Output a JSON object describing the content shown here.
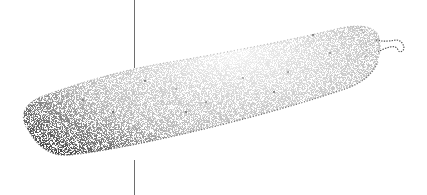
{
  "image": {
    "subject": "stipple illustration of a zucchini",
    "style": "black ink stippling on white",
    "background": "#ffffff",
    "ink_color": "#3a3a3a",
    "line_color": "#6e6e6e"
  }
}
